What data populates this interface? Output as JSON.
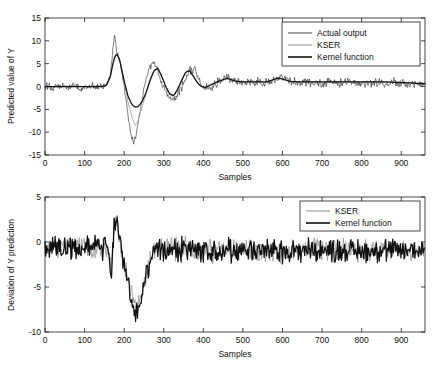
{
  "figure": {
    "background": "#ffffff",
    "panels": [
      "top",
      "bottom"
    ]
  },
  "chart_data": [
    {
      "id": "top",
      "type": "line",
      "title": "",
      "xlabel": "Samples",
      "ylabel": "Predicted value of Y",
      "xlim": [
        0,
        960
      ],
      "ylim": [
        -15,
        15
      ],
      "xticks": [
        0,
        100,
        200,
        300,
        400,
        500,
        600,
        700,
        800,
        900
      ],
      "yticks": [
        -15,
        -10,
        -5,
        0,
        5,
        10,
        15
      ],
      "xticklabels": [
        "0",
        "100",
        "200",
        "300",
        "400",
        "500",
        "600",
        "700",
        "800",
        "900"
      ],
      "yticklabels": [
        "-15",
        "-10",
        "-5",
        "0",
        "5",
        "10",
        "15"
      ],
      "grid": false,
      "legend": {
        "position": "top-right",
        "entries": [
          {
            "name": "Actual output",
            "color": "#2b2b2b",
            "width": 0.6
          },
          {
            "name": "KSER",
            "color": "#9a9a9a",
            "width": 0.8
          },
          {
            "name": "Kernel function",
            "color": "#111111",
            "width": 1.25
          }
        ]
      },
      "series": [
        {
          "name": "Actual output",
          "color": "#2b2b2b",
          "noise_amplitude": 0.8,
          "description": "Noisy measured signal with large transient between samples 165 and 300",
          "x": [
            0,
            10,
            20,
            30,
            40,
            50,
            60,
            70,
            80,
            90,
            100,
            110,
            120,
            130,
            140,
            150,
            160,
            165,
            170,
            172,
            175,
            178,
            180,
            182,
            185,
            188,
            190,
            195,
            200,
            205,
            210,
            215,
            220,
            225,
            228,
            230,
            235,
            240,
            245,
            250,
            255,
            260,
            265,
            270,
            275,
            280,
            285,
            290,
            295,
            300,
            310,
            320,
            330,
            340,
            350,
            360,
            370,
            380,
            390,
            400,
            410,
            420,
            430,
            440,
            450,
            460,
            470,
            480,
            490,
            500,
            520,
            540,
            560,
            580,
            600,
            620,
            640,
            660,
            680,
            700,
            720,
            740,
            760,
            780,
            800,
            820,
            840,
            860,
            880,
            900,
            920,
            940,
            960
          ],
          "y": [
            0.0,
            0.3,
            -0.4,
            0.5,
            -0.3,
            0.2,
            -0.5,
            0.4,
            0.1,
            -0.6,
            0.3,
            -0.2,
            0.5,
            -0.4,
            0.2,
            0.0,
            1.0,
            3.0,
            6.5,
            9.0,
            11.0,
            9.5,
            8.0,
            7.5,
            7.0,
            6.0,
            5.0,
            2.5,
            0.0,
            -3.0,
            -6.5,
            -9.5,
            -11.5,
            -12.0,
            -11.5,
            -10.5,
            -8.0,
            -5.5,
            -3.0,
            -0.5,
            1.5,
            3.0,
            4.2,
            4.8,
            5.0,
            4.6,
            3.5,
            2.0,
            0.5,
            -0.5,
            -2.0,
            -3.0,
            -2.5,
            -1.0,
            0.8,
            2.4,
            4.0,
            3.2,
            1.5,
            0.3,
            -0.6,
            -0.2,
            0.4,
            1.2,
            1.6,
            2.0,
            1.5,
            0.8,
            1.0,
            1.2,
            0.9,
            1.1,
            0.8,
            1.4,
            2.2,
            1.3,
            0.8,
            1.0,
            0.9,
            0.6,
            1.0,
            0.7,
            1.1,
            0.8,
            0.9,
            0.6,
            1.0,
            0.7,
            0.9,
            0.8,
            0.5,
            0.7,
            0.4
          ]
        },
        {
          "name": "KSER",
          "color": "#9a9a9a",
          "description": "Smooth KSER estimate, dips to about -8.5 at the trough",
          "x": [
            0,
            20,
            40,
            60,
            80,
            100,
            120,
            140,
            155,
            165,
            172,
            178,
            182,
            188,
            195,
            200,
            210,
            220,
            228,
            235,
            245,
            255,
            265,
            275,
            285,
            295,
            305,
            315,
            325,
            335,
            345,
            355,
            365,
            375,
            385,
            395,
            405,
            420,
            440,
            460,
            480,
            500,
            530,
            560,
            590,
            620,
            650,
            680,
            710,
            740,
            770,
            800,
            830,
            860,
            890,
            920,
            960
          ],
          "y": [
            0.0,
            0.0,
            0.0,
            0.0,
            0.0,
            0.0,
            0.0,
            0.0,
            0.2,
            2.0,
            5.0,
            6.8,
            7.0,
            6.2,
            3.5,
            1.0,
            -3.5,
            -6.8,
            -8.5,
            -7.6,
            -4.6,
            -1.8,
            1.6,
            3.6,
            4.2,
            2.4,
            0.0,
            -1.8,
            -2.2,
            -0.8,
            1.2,
            3.0,
            3.6,
            2.4,
            0.9,
            0.0,
            -0.3,
            0.3,
            1.1,
            1.7,
            1.2,
            0.9,
            1.0,
            0.9,
            1.8,
            1.1,
            0.9,
            1.0,
            0.9,
            1.0,
            0.9,
            1.0,
            0.9,
            0.9,
            0.9,
            0.8,
            0.6
          ]
        },
        {
          "name": "Kernel function",
          "color": "#111111",
          "description": "Smooth kernel-function estimate, trough only reaches about -4.5",
          "x": [
            0,
            20,
            40,
            60,
            80,
            100,
            120,
            140,
            155,
            165,
            172,
            178,
            182,
            188,
            195,
            200,
            210,
            220,
            228,
            235,
            245,
            255,
            265,
            275,
            285,
            295,
            305,
            315,
            325,
            335,
            345,
            355,
            365,
            375,
            385,
            395,
            405,
            420,
            440,
            460,
            480,
            500,
            530,
            560,
            590,
            620,
            650,
            680,
            710,
            740,
            770,
            800,
            830,
            860,
            890,
            920,
            960
          ],
          "y": [
            0.0,
            0.0,
            0.0,
            0.0,
            0.0,
            0.0,
            0.0,
            0.0,
            0.2,
            2.2,
            5.2,
            6.9,
            7.0,
            6.0,
            3.2,
            1.2,
            -2.2,
            -4.0,
            -4.5,
            -4.4,
            -3.4,
            -1.4,
            1.2,
            3.4,
            4.0,
            2.2,
            0.0,
            -1.6,
            -2.0,
            -0.6,
            1.3,
            3.1,
            3.5,
            2.2,
            0.8,
            0.0,
            -0.2,
            0.4,
            1.2,
            1.8,
            1.2,
            1.0,
            1.0,
            1.0,
            1.9,
            1.1,
            1.0,
            1.0,
            1.0,
            1.0,
            1.0,
            1.0,
            1.0,
            1.0,
            0.9,
            0.8,
            0.6
          ]
        }
      ]
    },
    {
      "id": "bottom",
      "type": "line",
      "title": "",
      "xlabel": "Samples",
      "ylabel": "Deviation of Y prediction",
      "xlim": [
        0,
        960
      ],
      "ylim": [
        -10,
        5
      ],
      "xticks": [
        0,
        100,
        200,
        300,
        400,
        500,
        600,
        700,
        800,
        900
      ],
      "yticks": [
        -10,
        -5,
        0,
        5
      ],
      "xticklabels": [
        "0",
        "100",
        "200",
        "300",
        "400",
        "500",
        "600",
        "700",
        "800",
        "900"
      ],
      "yticklabels": [
        "-10",
        "-5",
        "0",
        "5"
      ],
      "grid": false,
      "legend": {
        "position": "top-right",
        "entries": [
          {
            "name": "KSER",
            "color": "#9a9a9a",
            "width": 0.8
          },
          {
            "name": "Kernel function",
            "color": "#111111",
            "width": 1.25
          }
        ]
      },
      "series": [
        {
          "name": "KSER",
          "color": "#9a9a9a",
          "description": "Deviation residual, noisy around -1 with dip to about -7 near sample 230",
          "noise_amplitude": 1.2
        },
        {
          "name": "Kernel function",
          "color": "#111111",
          "description": "Deviation residual, noisy around -1 with dip to about -8 near sample 230",
          "noise_amplitude": 1.2
        }
      ]
    }
  ]
}
